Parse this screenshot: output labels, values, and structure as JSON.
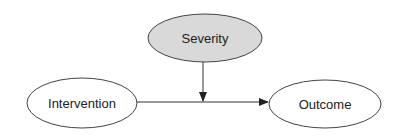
{
  "diagram": {
    "type": "causal-diagram",
    "nodes": [
      {
        "id": "severity",
        "label": "Severity",
        "fill": "#d9d9d9"
      },
      {
        "id": "intervention",
        "label": "Intervention",
        "fill": "#ffffff"
      },
      {
        "id": "outcome",
        "label": "Outcome",
        "fill": "#ffffff"
      }
    ],
    "edges": [
      {
        "from": "intervention",
        "to": "outcome"
      },
      {
        "from": "severity",
        "to": "intervention-outcome-edge"
      }
    ],
    "stroke_color": "#333333"
  }
}
